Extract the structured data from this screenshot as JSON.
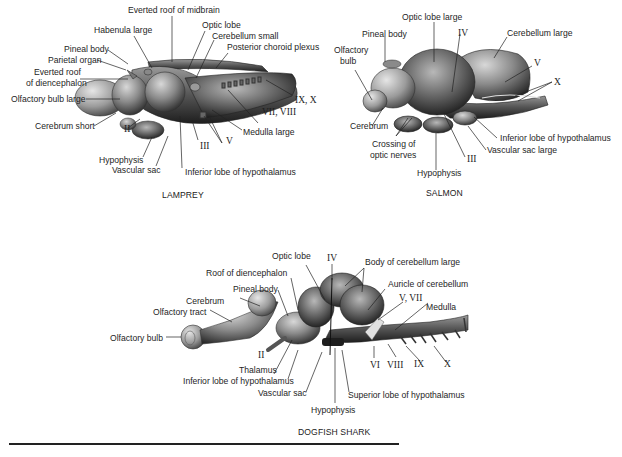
{
  "figures": [
    {
      "caption": "LAMPREY",
      "labels": {
        "everted_roof_midbrain": "Everted roof of midbrain",
        "habenula": "Habenula large",
        "optic_lobe": "Optic lobe",
        "cerebellum": "Cerebellum small",
        "posterior_choroid": "Posterior choroid plexus",
        "pineal": "Pineal body",
        "parietal": "Parietal organ",
        "everted_roof_dien_1": "Everted roof",
        "everted_roof_dien_2": "of diencephalon",
        "olfactory_bulb": "Olfactory bulb large",
        "nerve_ix_x": "IX, X",
        "nerve_vii_viii": "VII, VIII",
        "cerebrum": "Cerebrum short",
        "nerve_ii": "II",
        "nerve_v": "V",
        "medulla": "Medulla large",
        "nerve_iii": "III",
        "hypophysis": "Hypophysis",
        "vascular_sac": "Vascular sac",
        "inferior_lobe": "Inferior lobe of hypothalamus"
      }
    },
    {
      "caption": "SALMON",
      "labels": {
        "optic_lobe": "Optic lobe large",
        "pineal": "Pineal body",
        "nerve_iv": "IV",
        "cerebellum": "Cerebellum large",
        "olfactory_1": "Olfactory",
        "olfactory_2": "bulb",
        "nerve_v": "V",
        "nerve_x": "X",
        "cerebrum": "Cerebrum",
        "crossing_1": "Crossing of",
        "crossing_2": "optic nerves",
        "inferior_lobe": "Inferior lobe of hypothalamus",
        "vascular_sac": "Vascular sac large",
        "nerve_iii": "III",
        "hypophysis": "Hypophysis"
      }
    },
    {
      "caption": "DOGFISH SHARK",
      "labels": {
        "optic_lobe": "Optic lobe",
        "nerve_iv": "IV",
        "body_cerebellum": "Body of cerebellum large",
        "roof_dien": "Roof of diencephalon",
        "auricle": "Auricle of cerebellum",
        "pineal": "Pineal body",
        "nerve_v_vii": "V, VII",
        "cerebrum": "Cerebrum",
        "medulla": "Medulla",
        "olfactory_tract": "Olfactory tract",
        "olfactory_bulb": "Olfactory bulb",
        "nerve_ii": "II",
        "nerve_vi": "VI",
        "nerve_viii": "VIII",
        "nerve_ix": "IX",
        "nerve_x": "X",
        "thalamus": "Thalamus",
        "inferior_lobe": "Inferior lobe of hypothalamus",
        "vascular_sac": "Vascular sac",
        "superior_lobe": "Superior lobe of hypothalamus",
        "hypophysis": "Hypophysis"
      }
    }
  ]
}
